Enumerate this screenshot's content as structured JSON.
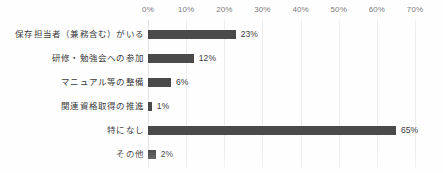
{
  "chart_data": {
    "type": "bar",
    "orientation": "horizontal",
    "title": "",
    "subtitle": "",
    "xlabel": "",
    "ylabel": "",
    "xlim": [
      0,
      70
    ],
    "xtick_labels": [
      "0%",
      "10%",
      "20%",
      "30%",
      "40%",
      "50%",
      "60%",
      "70%"
    ],
    "xtick_values": [
      0,
      10,
      20,
      30,
      40,
      50,
      60,
      70
    ],
    "xtick_position": "top",
    "grid": true,
    "grid_axis": "x",
    "legend": false,
    "legend_position": "none",
    "bar_color": "#4a4a4a",
    "gridline_color": "#ededed",
    "background_color": "#ffffff",
    "value_label_suffix": "%",
    "categories": [
      "保存担当者（兼務含む）がいる",
      "研修・勉強会への参加",
      "マニュアル等の整備",
      "関連資格取得の推進",
      "特になし",
      "その他"
    ],
    "values": [
      23,
      12,
      6,
      1,
      65,
      2
    ],
    "data_labels": [
      "23%",
      "12%",
      "6%",
      "1%",
      "65%",
      "2%"
    ],
    "bars": [
      {
        "category": "保存担当者（兼務含む）がいる",
        "value": 23,
        "label": "23%"
      },
      {
        "category": "研修・勉強会への参加",
        "value": 12,
        "label": "12%"
      },
      {
        "category": "マニュアル等の整備",
        "value": 6,
        "label": "6%"
      },
      {
        "category": "関連資格取得の推進",
        "value": 1,
        "label": "1%"
      },
      {
        "category": "特になし",
        "value": 65,
        "label": "65%"
      },
      {
        "category": "その他",
        "value": 2,
        "label": "2%"
      }
    ]
  }
}
